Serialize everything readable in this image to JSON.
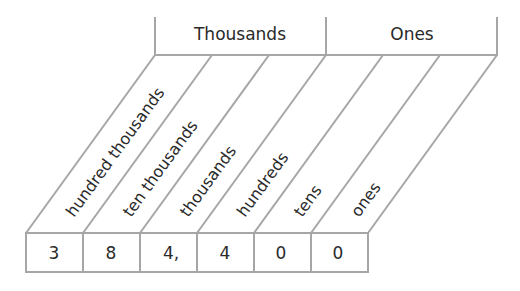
{
  "periods": [
    {
      "label": "Thousands"
    },
    {
      "label": "Ones"
    }
  ],
  "places": [
    {
      "label": "hundred thousands",
      "digit": "3"
    },
    {
      "label": "ten thousands",
      "digit": "8"
    },
    {
      "label": "thousands",
      "digit": "4,"
    },
    {
      "label": "hundreds",
      "digit": "4"
    },
    {
      "label": "tens",
      "digit": "0"
    },
    {
      "label": "ones",
      "digit": "0"
    }
  ],
  "number": "384,400",
  "colors": {
    "line": "#a6a6a6",
    "text": "#2a2a2a"
  }
}
